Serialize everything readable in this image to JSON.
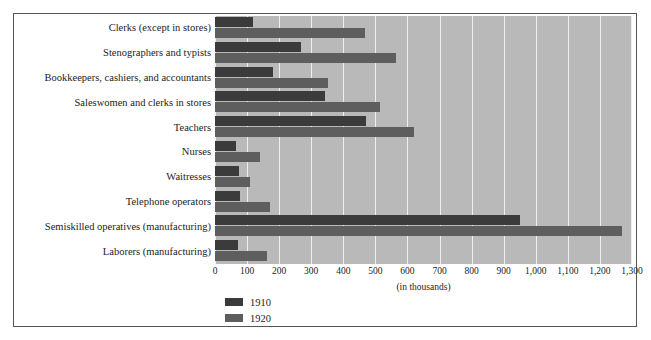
{
  "chart_data": {
    "type": "bar",
    "orientation": "horizontal",
    "title": "",
    "xlabel": "(in thousands)",
    "ylabel": "",
    "xlim": [
      0,
      1300
    ],
    "xticks": [
      0,
      100,
      200,
      300,
      400,
      500,
      600,
      700,
      800,
      900,
      1000,
      1100,
      1200,
      1300
    ],
    "xtick_labels": [
      "0",
      "100",
      "200",
      "300",
      "400",
      "500",
      "600",
      "700",
      "800",
      "900",
      "1,000",
      "1,100",
      "1,200",
      "1,300"
    ],
    "grid": true,
    "legend_position": "bottom-left",
    "categories": [
      "Clerks (except in stores)",
      "Stenographers and typists",
      "Bookkeepers, cashiers, and accountants",
      "Saleswomen and clerks in stores",
      "Teachers",
      "Nurses",
      "Waitresses",
      "Telephone operators",
      "Semiskilled operatives (manufacturing)",
      "Laborers (manufacturing)"
    ],
    "series": [
      {
        "name": "1910",
        "color": "#3b3b3b",
        "values": [
          117,
          268,
          180,
          343,
          470,
          64,
          75,
          77,
          950,
          71
        ]
      },
      {
        "name": "1920",
        "color": "#5e5e5e",
        "values": [
          468,
          563,
          353,
          515,
          620,
          140,
          109,
          170,
          1270,
          162
        ]
      }
    ]
  },
  "legend": {
    "entries": [
      {
        "label": "1910",
        "swatch": "s1910"
      },
      {
        "label": "1920",
        "swatch": "s1920"
      }
    ]
  },
  "colors": {
    "plot_background": "#b9b9b9",
    "gridline": "#efefef",
    "series_1910": "#3b3b3b",
    "series_1920": "#5e5e5e",
    "frame_border": "#555555"
  }
}
